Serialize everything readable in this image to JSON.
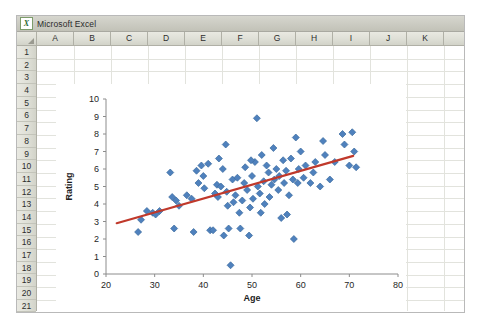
{
  "window": {
    "title": "Microsoft Excel",
    "app_icon": "excel-icon",
    "icon_letter": "X"
  },
  "spreadsheet": {
    "columns": [
      "A",
      "B",
      "C",
      "D",
      "E",
      "F",
      "G",
      "H",
      "I",
      "J",
      "K"
    ],
    "rows": [
      "1",
      "2",
      "3",
      "4",
      "5",
      "6",
      "7",
      "8",
      "9",
      "10",
      "11",
      "12",
      "13",
      "14",
      "15",
      "16",
      "17",
      "18",
      "19",
      "20",
      "21"
    ],
    "select_all_icon": "select-all-triangle-icon"
  },
  "chart_data": {
    "type": "scatter",
    "title": "",
    "xlabel": "Age",
    "ylabel": "Rating",
    "xlim": [
      20,
      80
    ],
    "ylim": [
      0,
      10
    ],
    "xticks": [
      20,
      30,
      40,
      50,
      60,
      70,
      80
    ],
    "yticks": [
      0,
      1,
      2,
      3,
      4,
      5,
      6,
      7,
      8,
      9,
      10
    ],
    "grid": false,
    "legend": "none",
    "marker": {
      "shape": "diamond",
      "fill": "#4f81bd",
      "edge": "#3a6a9e",
      "size": 7
    },
    "trendline": {
      "type": "linear",
      "color": "#c0392b",
      "width": 2.2,
      "x_start": 22.2,
      "y_start": 2.9,
      "x_end": 70.8,
      "y_end": 6.75
    },
    "points": [
      [
        26.6,
        2.4
      ],
      [
        27.2,
        3.1
      ],
      [
        28.4,
        3.6
      ],
      [
        29.6,
        3.5
      ],
      [
        31.0,
        3.6
      ],
      [
        33.2,
        5.8
      ],
      [
        33.6,
        4.4
      ],
      [
        34.4,
        4.2
      ],
      [
        34.0,
        2.6
      ],
      [
        36.6,
        4.5
      ],
      [
        37.6,
        4.3
      ],
      [
        38.0,
        2.4
      ],
      [
        39.0,
        5.2
      ],
      [
        39.6,
        6.2
      ],
      [
        40.2,
        4.9
      ],
      [
        40.0,
        5.6
      ],
      [
        41.0,
        6.3
      ],
      [
        41.4,
        2.5
      ],
      [
        42.0,
        2.5
      ],
      [
        42.8,
        5.1
      ],
      [
        42.4,
        4.6
      ],
      [
        43.0,
        4.4
      ],
      [
        43.6,
        5.0
      ],
      [
        44.0,
        6.0
      ],
      [
        44.6,
        7.4
      ],
      [
        44.8,
        4.7
      ],
      [
        45.0,
        3.9
      ],
      [
        45.2,
        2.6
      ],
      [
        45.6,
        0.5
      ],
      [
        46.0,
        5.4
      ],
      [
        46.2,
        4.1
      ],
      [
        46.6,
        4.5
      ],
      [
        47.0,
        5.5
      ],
      [
        47.4,
        3.5
      ],
      [
        47.6,
        2.6
      ],
      [
        48.0,
        4.2
      ],
      [
        48.4,
        5.2
      ],
      [
        48.6,
        6.1
      ],
      [
        49.0,
        4.8
      ],
      [
        49.4,
        2.2
      ],
      [
        49.6,
        3.8
      ],
      [
        50.0,
        5.6
      ],
      [
        50.2,
        4.3
      ],
      [
        50.6,
        6.4
      ],
      [
        51.0,
        8.9
      ],
      [
        51.2,
        5.0
      ],
      [
        51.6,
        4.6
      ],
      [
        52.0,
        6.8
      ],
      [
        52.4,
        5.3
      ],
      [
        52.6,
        4.0
      ],
      [
        53.0,
        6.2
      ],
      [
        53.4,
        5.8
      ],
      [
        53.6,
        4.4
      ],
      [
        54.0,
        5.1
      ],
      [
        54.4,
        7.2
      ],
      [
        54.6,
        5.4
      ],
      [
        55.0,
        6.0
      ],
      [
        55.4,
        4.8
      ],
      [
        55.6,
        5.6
      ],
      [
        56.0,
        3.2
      ],
      [
        56.4,
        6.5
      ],
      [
        56.6,
        5.2
      ],
      [
        57.0,
        5.9
      ],
      [
        57.6,
        4.5
      ],
      [
        58.0,
        6.6
      ],
      [
        58.4,
        5.4
      ],
      [
        58.6,
        2.0
      ],
      [
        59.0,
        7.8
      ],
      [
        59.4,
        5.2
      ],
      [
        59.6,
        6.0
      ],
      [
        60.0,
        7.0
      ],
      [
        60.6,
        5.5
      ],
      [
        61.0,
        6.2
      ],
      [
        62.0,
        5.2
      ],
      [
        63.0,
        6.4
      ],
      [
        64.0,
        5.0
      ],
      [
        64.6,
        7.6
      ],
      [
        65.0,
        6.8
      ],
      [
        66.0,
        5.4
      ],
      [
        67.0,
        6.4
      ],
      [
        68.6,
        8.0
      ],
      [
        69.0,
        7.4
      ],
      [
        70.0,
        6.2
      ],
      [
        70.6,
        8.1
      ],
      [
        71.0,
        7.0
      ],
      [
        71.4,
        6.1
      ],
      [
        62.6,
        5.8
      ],
      [
        35.0,
        3.9
      ],
      [
        30.2,
        3.4
      ],
      [
        43.2,
        6.6
      ],
      [
        51.8,
        3.5
      ],
      [
        38.6,
        5.9
      ],
      [
        57.2,
        3.4
      ],
      [
        44.2,
        2.2
      ],
      [
        49.8,
        6.5
      ]
    ]
  }
}
